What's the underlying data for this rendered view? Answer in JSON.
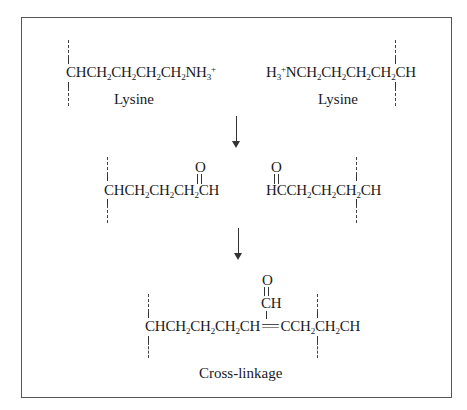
{
  "figure": {
    "row1": {
      "left": {
        "formula_parts": [
          "CHCH",
          "2",
          "CH",
          "2",
          "CH",
          "2",
          "CH",
          "2",
          "NH",
          "3",
          "+"
        ],
        "label": "Lysine"
      },
      "right": {
        "formula_parts": [
          "H",
          "3",
          "+",
          "NCH",
          "2",
          "CH",
          "2",
          "CH",
          "2",
          "CH",
          "2",
          "CH"
        ],
        "label": "Lysine"
      }
    },
    "row2": {
      "left": {
        "carbonyl_o": "O",
        "formula_parts": [
          "CHCH",
          "2",
          "CH",
          "2",
          "CH",
          "2",
          "CH"
        ]
      },
      "right": {
        "carbonyl_o": "O",
        "formula_parts": [
          "HCCH",
          "2",
          "CH",
          "2",
          "CH",
          "2",
          "CH"
        ]
      }
    },
    "row3": {
      "carbonyl_o": "O",
      "branch_ch": "CH",
      "formula_parts": [
        "CHCH",
        "2",
        "CH",
        "2",
        "CH",
        "2",
        "CH",
        "=",
        "CCH",
        "2",
        "CH",
        "2",
        "CH"
      ],
      "label": "Cross-linkage"
    }
  }
}
